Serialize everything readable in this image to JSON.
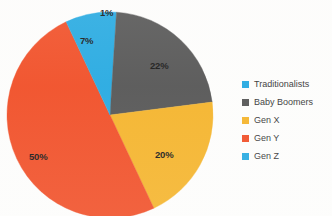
{
  "chart_data": {
    "type": "pie",
    "title": "",
    "subtitle": "",
    "xlabel": "",
    "ylabel": "",
    "legend_position": "right",
    "grid": false,
    "categories": [
      "Traditionalists",
      "Baby Boomers",
      "Gen X",
      "Gen Y",
      "Gen Z"
    ],
    "values": [
      1,
      22,
      20,
      50,
      7
    ],
    "value_labels": [
      "1%",
      "22%",
      "20%",
      "50%",
      "7%"
    ],
    "colors": [
      "#29ABE2",
      "#585858",
      "#F5B52E",
      "#F1512A",
      "#29ABE2"
    ],
    "slices": [
      {
        "label": "Traditionalists",
        "value": 1,
        "value_label": "1%",
        "color": "#29ABE2"
      },
      {
        "label": "Baby Boomers",
        "value": 22,
        "value_label": "22%",
        "color": "#585858"
      },
      {
        "label": "Gen X",
        "value": 20,
        "value_label": "20%",
        "color": "#F5B52E"
      },
      {
        "label": "Gen Y",
        "value": 50,
        "value_label": "50%",
        "color": "#F1512A"
      },
      {
        "label": "Gen Z",
        "value": 7,
        "value_label": "7%",
        "color": "#29ABE2"
      }
    ]
  },
  "legend": {
    "items": [
      {
        "label": "Traditionalists",
        "color": "#29ABE2"
      },
      {
        "label": "Baby Boomers",
        "color": "#585858"
      },
      {
        "label": "Gen X",
        "color": "#F5B52E"
      },
      {
        "label": "Gen Y",
        "color": "#F1512A"
      },
      {
        "label": "Gen Z",
        "color": "#29ABE2"
      }
    ]
  }
}
